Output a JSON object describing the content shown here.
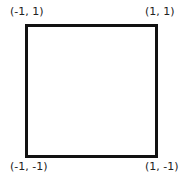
{
  "diagram": {
    "shape": "square",
    "stroke_color": "#111111",
    "vertices": [
      {
        "position": "top-left",
        "label": "(-1, 1)"
      },
      {
        "position": "top-right",
        "label": "(1, 1)"
      },
      {
        "position": "bottom-left",
        "label": "(-1, -1)"
      },
      {
        "position": "bottom-right",
        "label": "(1, -1)"
      }
    ]
  }
}
